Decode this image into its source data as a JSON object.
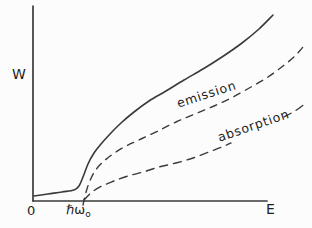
{
  "figure": {
    "kind": "hand-drawn physics plot",
    "background": "#fcfcfc",
    "line_color": "#3a3a3a",
    "text_color": "#1e1e1e"
  },
  "labels": {
    "y_axis": "W",
    "x_axis": "E",
    "origin": "0",
    "threshold_main": "ℏω",
    "threshold_sub": "o",
    "emission": "emission",
    "absorption": "absorption"
  },
  "chart_data": {
    "type": "line",
    "title": "",
    "xlabel": "E",
    "ylabel": "W",
    "x_tick_labels": [
      "0",
      "ℏω₀"
    ],
    "axis_notes": "arbitrary units; threshold at E = ℏω₀; curves extend past right end of axis",
    "axes_px": {
      "origin": [
        33,
        201
      ],
      "x_end": [
        267,
        201
      ],
      "y_top": [
        33,
        6
      ]
    },
    "series": [
      {
        "id": "solid-curve",
        "label": "",
        "line_style": "solid",
        "stroke_width": 1.6,
        "dash": "",
        "segments": [
          [
            [
              34,
              196
            ],
            [
              48,
              194
            ],
            [
              62,
              192
            ],
            [
              74,
              190
            ],
            [
              79,
              186
            ],
            [
              83,
              177
            ],
            [
              88,
              164
            ],
            [
              94,
              153
            ],
            [
              101,
              144
            ],
            [
              110,
              134
            ],
            [
              121,
              123
            ],
            [
              134,
              112
            ],
            [
              149,
              101
            ],
            [
              166,
              91
            ],
            [
              184,
              80
            ],
            [
              203,
              69
            ],
            [
              222,
              57
            ],
            [
              242,
              43
            ],
            [
              259,
              29
            ],
            [
              273,
              15
            ]
          ]
        ]
      },
      {
        "id": "emission-curve",
        "label": "emission",
        "line_style": "dashed",
        "stroke_width": 1.4,
        "dash": "7 6",
        "segments": [
          [
            [
              83,
              205
            ],
            [
              85,
              196
            ],
            [
              89,
              183
            ],
            [
              95,
              171
            ],
            [
              103,
              162
            ],
            [
              113,
              154
            ],
            [
              126,
              146
            ],
            [
              141,
              139
            ],
            [
              158,
              131
            ],
            [
              176,
              122
            ],
            [
              195,
              114
            ],
            [
              214,
              106
            ],
            [
              233,
              97
            ],
            [
              251,
              87
            ],
            [
              268,
              77
            ],
            [
              283,
              66
            ],
            [
              295,
              56
            ],
            [
              303,
              47
            ]
          ]
        ]
      },
      {
        "id": "absorption-curve",
        "label": "absorption",
        "line_style": "dashed",
        "stroke_width": 1.4,
        "dash": "8 6",
        "segments": [
          [
            [
              84,
              200
            ],
            [
              92,
              192
            ],
            [
              102,
              186
            ],
            [
              114,
              181
            ],
            [
              128,
              176
            ],
            [
              143,
              172
            ],
            [
              159,
              167
            ],
            [
              176,
              163
            ],
            [
              193,
              158
            ],
            [
              209,
              152
            ],
            [
              222,
              147
            ],
            [
              231,
              143
            ]
          ],
          [
            [
              284,
              117
            ],
            [
              295,
              111
            ],
            [
              306,
              103
            ]
          ]
        ]
      }
    ]
  }
}
